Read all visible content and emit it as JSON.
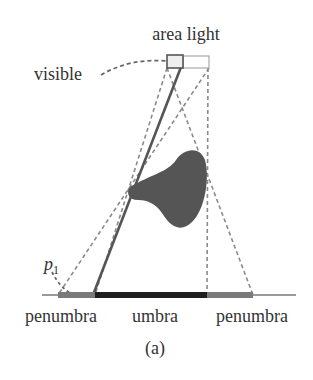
{
  "labels": {
    "area_light": "area light",
    "visible": "visible",
    "point": "p",
    "point_sub": "1",
    "penumbra_left": "penumbra",
    "umbra": "umbra",
    "penumbra_right": "penumbra",
    "caption": "(a)"
  },
  "colors": {
    "text": "#333333",
    "blocker": "#555555",
    "umbra": "#1e1e1e",
    "penumbra": "#7a7a7a",
    "ground": "#9a9a9a",
    "dashed": "#8a8a8a",
    "solid_ray": "#555555",
    "light_visible_border": "#555555",
    "light_border": "#aaaaaa"
  }
}
